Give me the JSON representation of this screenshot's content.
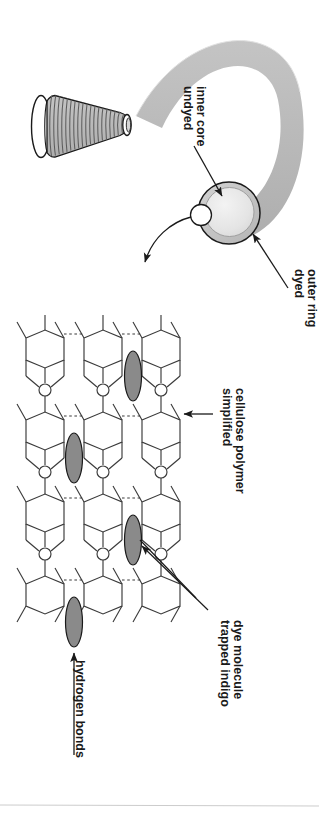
{
  "figure": {
    "orientation": "labels rotated 90 degrees clockwise",
    "background_color": "#ffffff",
    "ink_color": "#1a1a1a"
  },
  "colors": {
    "outline": "#1a1a1a",
    "yarn_ribbon": "#b7b7b7",
    "dyed_outer_ring": "#c2c2c2",
    "undyed_inner_core": "#e8e8e8",
    "dye_molecule": "#8a8a8a",
    "spool_thread": "#9a9a9a",
    "spool_body": "#c9c9c9",
    "footer_rule": "#cccccc"
  },
  "labels": {
    "undyed_inner_core": {
      "lines": [
        "undyed",
        "inner core"
      ],
      "points_to": "yarn-cross-section-core"
    },
    "dyed_outer_ring": {
      "lines": [
        "dyed",
        "outer ring"
      ],
      "points_to": "yarn-cross-section-ring"
    },
    "simplified_cellulose_polymer": {
      "lines": [
        "simplified",
        "cellulose polymer"
      ],
      "points_to": "cellulose-hexagon-ring"
    },
    "trapped_indigo_dye_molecule": {
      "lines": [
        "trapped indigo",
        "dye molecule"
      ],
      "points_to": "dye-molecule-ellipse"
    },
    "hydrogen_bonds": {
      "lines": [
        "hydrogen bonds"
      ],
      "points_to": "hydrogen-bond-dashes"
    }
  },
  "atoms": {
    "oxygen_symbol": "O"
  },
  "diagram_parts": {
    "spool": "cone-shaped yarn spool with wound thread",
    "yarn_ribbon": "curved gray yarn band leading to cross-section",
    "cross_section": "circular cut showing dyed outer ring and undyed inner core",
    "magnify_arrow": "curved arrow from small circle down-left to molecular view",
    "polymer_chains": 3,
    "dye_molecules": 4
  }
}
